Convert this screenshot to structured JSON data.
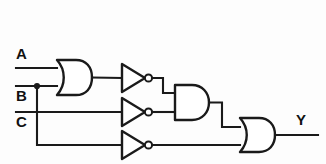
{
  "diagram": {
    "type": "digital-logic-schematic",
    "background_color": "#fdfdfd",
    "line_color": "#1a1a1a"
  },
  "inputs": [
    {
      "id": "A",
      "label": "A",
      "x": 16,
      "y": 46,
      "wire_y": 68
    },
    {
      "id": "B",
      "label": "B",
      "x": 16,
      "y": 88,
      "wire_y": 86
    },
    {
      "id": "C",
      "label": "C",
      "x": 16,
      "y": 114,
      "wire_y": 112
    }
  ],
  "outputs": [
    {
      "id": "Y",
      "label": "Y",
      "x": 296,
      "y": 112,
      "wire_y": 135
    }
  ],
  "gates": [
    {
      "id": "or1",
      "type": "OR",
      "label": "",
      "x": 55,
      "y": 60,
      "inputs": [
        "A",
        "B"
      ],
      "output": "n1"
    },
    {
      "id": "inv1",
      "type": "NOT",
      "label": "",
      "x": 120,
      "y": 64,
      "inputs": [
        "n1"
      ],
      "output": "n2"
    },
    {
      "id": "inv2",
      "type": "NOT",
      "label": "",
      "x": 120,
      "y": 98,
      "inputs": [
        "C"
      ],
      "output": "n3"
    },
    {
      "id": "inv3",
      "type": "NOT",
      "label": "",
      "x": 120,
      "y": 131,
      "inputs": [
        "B"
      ],
      "output": "n4"
    },
    {
      "id": "and1",
      "type": "AND",
      "label": "",
      "x": 173,
      "y": 85,
      "inputs": [
        "n2",
        "n3"
      ],
      "output": "n5"
    },
    {
      "id": "or2",
      "type": "OR",
      "label": "",
      "x": 238,
      "y": 118,
      "inputs": [
        "n5",
        "n4"
      ],
      "output": "Y"
    }
  ],
  "junctions": [
    {
      "id": "j-b",
      "net": "B",
      "x": 37,
      "y": 86
    }
  ],
  "crossings": [
    {
      "id": "x-bc",
      "nets": [
        "B",
        "C"
      ],
      "x": 37,
      "y": 112,
      "connected": false
    }
  ],
  "nets": [
    {
      "id": "A",
      "from": "input-A",
      "to": "or1.in0"
    },
    {
      "id": "B",
      "from": "input-B",
      "to": "or1.in1"
    },
    {
      "id": "B2",
      "from": "j-b",
      "to": "inv3.in0"
    },
    {
      "id": "C",
      "from": "input-C",
      "to": "inv2.in0"
    },
    {
      "id": "n1",
      "from": "or1.out",
      "to": "inv1.in0"
    },
    {
      "id": "n2",
      "from": "inv1.out",
      "to": "and1.in0"
    },
    {
      "id": "n3",
      "from": "inv2.out",
      "to": "and1.in1"
    },
    {
      "id": "n4",
      "from": "inv3.out",
      "to": "or2.in1"
    },
    {
      "id": "n5",
      "from": "and1.out",
      "to": "or2.in0"
    },
    {
      "id": "Y",
      "from": "or2.out",
      "to": "output-Y"
    }
  ]
}
